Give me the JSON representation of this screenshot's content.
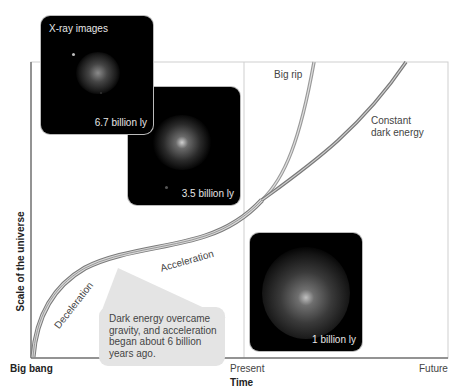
{
  "diagram": {
    "axes": {
      "x_label": "Time",
      "y_label": "Scale of the universe",
      "x_ticks": [
        "Big bang",
        "Present",
        "Future"
      ]
    },
    "curves": [
      {
        "name": "Big rip",
        "label": "Big rip",
        "color": "#9a9a9a"
      },
      {
        "name": "Constant dark energy",
        "label_line1": "Constant",
        "label_line2": "dark energy",
        "color": "#8a8a8a"
      }
    ],
    "phase_labels": {
      "deceleration": "Deceleration",
      "acceleration": "Acceleration"
    },
    "callout": {
      "text": "Dark energy overcame gravity, and acceleration began about 6 billion years ago."
    },
    "panels": [
      {
        "title": "X-ray images",
        "caption": "6.7 billion ly"
      },
      {
        "caption": "3.5 billion ly"
      },
      {
        "caption": "1 billion ly"
      }
    ],
    "colors": {
      "axis": "#777777",
      "frame": "#c8c8c8",
      "panel_bg": "#000000",
      "callout_bg": "#e4e4e4"
    }
  }
}
